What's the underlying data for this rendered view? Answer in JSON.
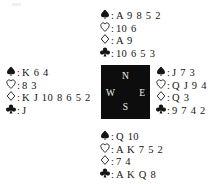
{
  "diagram": {
    "type": "bridge-deal-diagram",
    "suit_symbols": {
      "spade": "♠",
      "heart": "♡",
      "diamond": "♢",
      "club": "♣"
    },
    "separator": ":",
    "ink_color": "#151515",
    "compass_background": "#0d0d0d",
    "compass_text_color": "#f2f0ec"
  },
  "compass": {
    "north": "N",
    "west": "W",
    "east": "E",
    "south": "S"
  },
  "hands": {
    "north": {
      "position": "North",
      "spades": "A 9 8 5 2",
      "hearts": "10 6",
      "diamonds": "A 9",
      "clubs": "10 6 5 3"
    },
    "west": {
      "position": "West",
      "spades": "K 6 4",
      "hearts": "8 3",
      "diamonds": "K J 10 8 6 5 2",
      "clubs": "J"
    },
    "east": {
      "position": "East",
      "spades": "J 7 3",
      "hearts": "Q J 9 4",
      "diamonds": "Q 3",
      "clubs": "9 7 4 2"
    },
    "south": {
      "position": "South",
      "spades": "Q 10",
      "hearts": "A K 7 5 2",
      "diamonds": "7 4",
      "clubs": "A K Q 8"
    }
  }
}
